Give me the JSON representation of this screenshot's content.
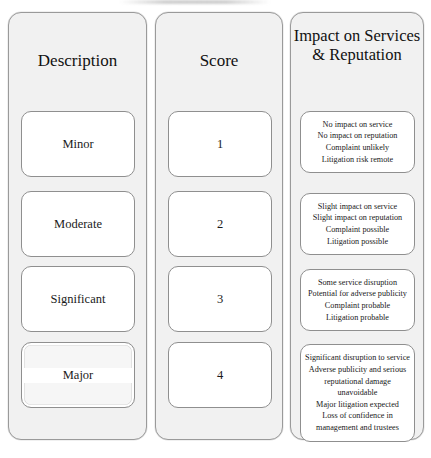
{
  "document": {
    "title": "Risk Impact Matrix",
    "type": "risk-scoring-table"
  },
  "colors": {
    "panel_background": "#f1f1f1",
    "cell_background": "#ffffff",
    "border": "#8f8f8f",
    "text": "#1a1a1a",
    "page_background": "#ffffff"
  },
  "columns": [
    {
      "key": "description",
      "header": "Description"
    },
    {
      "key": "score",
      "header": "Score"
    },
    {
      "key": "impact",
      "header_line1": "Impact on Services",
      "header_line2": "& Reputation"
    }
  ],
  "rows": [
    {
      "description": "Minor",
      "score": "1",
      "selected": false,
      "impact_lines": [
        "No impact on service",
        "No impact on reputation",
        "Complaint unlikely",
        "Litigation risk remote"
      ]
    },
    {
      "description": "Moderate",
      "score": "2",
      "selected": false,
      "impact_lines": [
        "Slight impact on service",
        "Slight impact on reputation",
        "Complaint possible",
        "Litigation possible"
      ]
    },
    {
      "description": "Significant",
      "score": "3",
      "selected": false,
      "impact_lines": [
        "Some service disruption",
        "Potential for adverse publicity",
        "Complaint probable",
        "Litigation probable"
      ]
    },
    {
      "description": "Major",
      "score": "4",
      "selected": true,
      "impact_lines": [
        "Significant disruption to service",
        "Adverse publicity and serious reputational damage unavoidable",
        "Major litigation expected",
        "Loss of confidence in management and trustees"
      ]
    }
  ]
}
